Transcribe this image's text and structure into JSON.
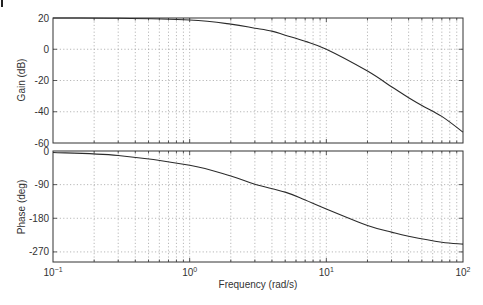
{
  "chart_data": [
    {
      "type": "line",
      "title": "",
      "xlabel": "",
      "ylabel": "Gain (dB)",
      "xscale": "log",
      "xlim": [
        0.1,
        100
      ],
      "ylim": [
        -60,
        20
      ],
      "yticks": [
        20,
        0,
        -20,
        -40,
        -60
      ],
      "ytick_labels": [
        "20",
        "0",
        "-20",
        "-40",
        "-60"
      ],
      "grid": true,
      "series": [
        {
          "name": "Gain",
          "x": [
            0.1,
            0.3,
            1,
            2,
            3,
            4,
            5,
            7,
            10,
            20,
            30,
            40,
            50,
            70,
            100
          ],
          "y": [
            20,
            19.9,
            18.7,
            16.1,
            13.5,
            11.6,
            9.0,
            5.1,
            0,
            -14,
            -24,
            -31,
            -36,
            -43,
            -53
          ]
        }
      ]
    },
    {
      "type": "line",
      "title": "",
      "xlabel": "Frequency (rad/s)",
      "ylabel": "Phase (deg)",
      "xscale": "log",
      "xlim": [
        0.1,
        100
      ],
      "ylim": [
        -297,
        0
      ],
      "yticks": [
        0,
        -90,
        -180,
        -270
      ],
      "ytick_labels": [
        "0",
        "-90",
        "-180",
        "-270"
      ],
      "xtick_labels": [
        "10^-1",
        "10^0",
        "10^1",
        "10^2"
      ],
      "grid": true,
      "series": [
        {
          "name": "Phase",
          "x": [
            0.1,
            0.3,
            1,
            2,
            3,
            5,
            7,
            10,
            20,
            30,
            40,
            70,
            100
          ],
          "y": [
            -4,
            -12,
            -38,
            -67,
            -89,
            -110,
            -131,
            -155,
            -199,
            -217,
            -228,
            -244,
            -249
          ]
        }
      ]
    }
  ],
  "labels": {
    "gain_axis": "Gain (dB)",
    "phase_axis": "Phase (deg)",
    "frequency_axis": "Frequency (rad/s)",
    "x_tick_bases": [
      "10",
      "10",
      "10",
      "10"
    ],
    "x_tick_exps": [
      "−1",
      "0",
      "1",
      "2"
    ]
  },
  "colors": {
    "curve": "#2b2b2b",
    "frame": "#333333",
    "grid": "#9a9a9a"
  }
}
